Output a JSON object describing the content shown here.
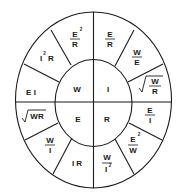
{
  "diagram": {
    "colors": {
      "stroke": "#1a1a1a",
      "background": "#ffffff"
    },
    "inner": {
      "W": "W",
      "I": "I",
      "E": "E",
      "R": "R"
    },
    "outer": {
      "e2_over_r": {
        "num": "E",
        "sup": "2",
        "den": "R"
      },
      "i2r": {
        "base": "I",
        "sup": "2",
        "tail": "R"
      },
      "ei": "E I",
      "sqrt_wr": "WR",
      "w_over_i": {
        "num": "W",
        "den": "I"
      },
      "ir": "I R",
      "w_over_i2": {
        "num": "W",
        "den": "I",
        "sup": "2"
      },
      "e2_over_w": {
        "num": "E",
        "sup": "2",
        "den": "W"
      },
      "e_over_i": {
        "num": "E",
        "den": "I"
      },
      "sqrt_w_over_r": {
        "num": "W",
        "den": "R"
      },
      "w_over_e": {
        "num": "W",
        "den": "E"
      },
      "e_over_r": {
        "num": "E",
        "den": "R"
      }
    }
  }
}
